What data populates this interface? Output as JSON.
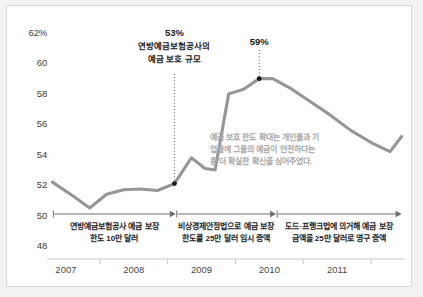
{
  "chart_data": {
    "type": "line",
    "title": "",
    "subtitle": "",
    "xlabel": "",
    "ylabel": "",
    "ylim": [
      48,
      62
    ],
    "xlim": [
      2006.75,
      2012.0
    ],
    "grid": false,
    "legend_position": "none",
    "y_ticks": [
      "62%",
      "60",
      "58",
      "56",
      "54",
      "52",
      "50",
      "48"
    ],
    "y_tick_values": [
      62,
      60,
      58,
      56,
      54,
      52,
      50,
      48
    ],
    "x_ticks": [
      "2007",
      "2008",
      "2009",
      "2010",
      "2011"
    ],
    "x_tick_values": [
      2007,
      2008,
      2009,
      2010,
      2011
    ],
    "series": [
      {
        "name": "예금 보호 비율",
        "color": "#969696",
        "x": [
          2006.8,
          2007.1,
          2007.35,
          2007.6,
          2007.85,
          2008.1,
          2008.35,
          2008.6,
          2008.85,
          2009.05,
          2009.2,
          2009.4,
          2009.62,
          2009.85,
          2010.05,
          2010.3,
          2010.6,
          2010.9,
          2011.2,
          2011.5,
          2011.78,
          2011.95
        ],
        "values": [
          52.2,
          51.3,
          50.5,
          51.4,
          51.7,
          51.75,
          51.65,
          52.1,
          53.8,
          53.1,
          53.0,
          58.0,
          58.3,
          59.0,
          59.0,
          58.4,
          57.5,
          56.6,
          55.6,
          54.8,
          54.2,
          55.2
        ]
      }
    ],
    "markers": [
      {
        "label": "53%",
        "x": 2008.6,
        "y": 52.1
      },
      {
        "label": "59%",
        "x": 2009.85,
        "y": 59.0
      }
    ],
    "annotations": [
      {
        "id": "callout-53",
        "percent": "53%",
        "lines": [
          "연방예금보험공사의",
          "예금 보호 규모"
        ],
        "x": 2008.6,
        "y": 52.1
      },
      {
        "id": "callout-59",
        "percent": "59%",
        "lines": [],
        "x": 2009.85,
        "y": 59.0
      }
    ],
    "note": {
      "lines": [
        "예금 보호 한도 확대는 개인들과 기",
        "업들에 그들의 예금이 안전하다는",
        "좀 더 확실한 확신을 심어주었다."
      ],
      "color": "#a8a8a8"
    },
    "bands": [
      {
        "id": "band-1",
        "lines": [
          "연방예금보험공사 예금 보장",
          "한도 10만 달러"
        ],
        "x_start": 2006.8,
        "x_end": 2008.62
      },
      {
        "id": "band-2",
        "lines": [
          "비상경제안정법으로 예금 보장",
          "한도를 25만 달러 임시 증액"
        ],
        "x_start": 2008.62,
        "x_end": 2010.1
      },
      {
        "id": "band-3",
        "lines": [
          "도드·프랭크법에 의거해 예금 보장",
          "금액을 25만 달러로 영구 증액"
        ],
        "x_start": 2010.1,
        "x_end": 2011.95
      }
    ]
  },
  "colors": {
    "line": "#969696",
    "marker": "#1a1a1a",
    "axis": "#c9c9c9",
    "tick_text": "#3d3d3d",
    "note_text": "#a8a8a8",
    "panel_bg": "#ffffff",
    "page_bg": "#f2f2f2",
    "panel_border": "#d9d9d9"
  }
}
